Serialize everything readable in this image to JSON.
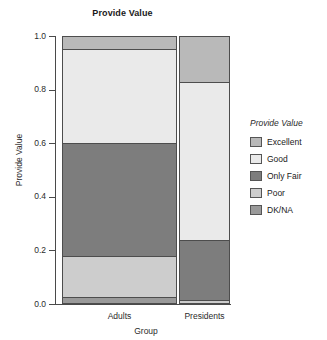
{
  "chart_data": {
    "type": "bar",
    "subtype": "stacked-proportional-mosaic",
    "title": "Provide Value",
    "xlabel": "Group",
    "ylabel": "Provide Value",
    "categories": [
      "Adults",
      "Presidents"
    ],
    "ylim": [
      0.0,
      1.0
    ],
    "ytick_labels": [
      "1.0",
      "0.8",
      "0.6",
      "0.4",
      "0.2",
      "0.0"
    ],
    "ytick_values": [
      1.0,
      0.8,
      0.6,
      0.4,
      0.2,
      0.0
    ],
    "grid": false,
    "legend_position": "right",
    "legend_title": "Provide Value",
    "stack_order_top_to_bottom": [
      "Excellent",
      "Good",
      "Only Fair",
      "Poor",
      "DK/NA"
    ],
    "series": [
      {
        "name": "Excellent",
        "color": "#b9b9b9",
        "values": [
          0.05,
          0.17
        ],
        "cumulative_top": [
          1.0,
          1.0
        ],
        "cumulative_bottom": [
          0.95,
          0.83
        ]
      },
      {
        "name": "Good",
        "color": "#eaeaea",
        "values": [
          0.35,
          0.59
        ],
        "cumulative_top": [
          0.95,
          0.83
        ],
        "cumulative_bottom": [
          0.6,
          0.24
        ]
      },
      {
        "name": "Only Fair",
        "color": "#7d7d7d",
        "values": [
          0.42,
          0.225
        ],
        "cumulative_top": [
          0.6,
          0.24
        ],
        "cumulative_bottom": [
          0.18,
          0.015
        ]
      },
      {
        "name": "Poor",
        "color": "#cdcdcd",
        "values": [
          0.155,
          0.01
        ],
        "cumulative_top": [
          0.18,
          0.015
        ],
        "cumulative_bottom": [
          0.025,
          0.005
        ]
      },
      {
        "name": "DK/NA",
        "color": "#9a9a9a",
        "values": [
          0.025,
          0.005
        ],
        "cumulative_top": [
          0.025,
          0.005
        ],
        "cumulative_bottom": [
          0.0,
          0.0
        ]
      }
    ],
    "group_widths_relative": [
      0.685,
      0.305
    ]
  },
  "legend": {
    "title": "Provide Value",
    "items": [
      {
        "label": "Excellent",
        "color": "#b9b9b9"
      },
      {
        "label": "Good",
        "color": "#eaeaea"
      },
      {
        "label": "Only Fair",
        "color": "#7d7d7d"
      },
      {
        "label": "Poor",
        "color": "#cdcdcd"
      },
      {
        "label": "DK/NA",
        "color": "#9a9a9a"
      }
    ]
  },
  "axes": {
    "y_title": "Provide Value",
    "x_title": "Group",
    "y_ticks": [
      {
        "label": "1.0",
        "value": 1.0
      },
      {
        "label": "0.8",
        "value": 0.8
      },
      {
        "label": "0.6",
        "value": 0.6
      },
      {
        "label": "0.4",
        "value": 0.4
      },
      {
        "label": "0.2",
        "value": 0.2
      },
      {
        "label": "0.0",
        "value": 0.0
      }
    ],
    "x_ticks": [
      {
        "label": "Adults"
      },
      {
        "label": "Presidents"
      }
    ]
  },
  "title": "Provide Value"
}
